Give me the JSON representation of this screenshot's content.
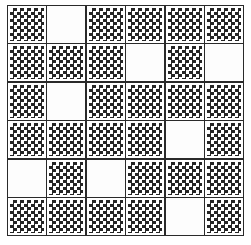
{
  "diagram": {
    "title": "",
    "type": "6x6 grid pattern",
    "rows": 6,
    "columns": 6,
    "cell_fill_legend": {
      "D": "dotted (black dot pattern)",
      "W": "white (empty)"
    },
    "colors": {
      "line": "#2a2a2a",
      "dot": "#1a1a1a",
      "background": "#ffffff"
    },
    "grid": [
      [
        "D",
        "W",
        "D",
        "D",
        "D",
        "D"
      ],
      [
        "D",
        "D",
        "D",
        "W",
        "D",
        "W"
      ],
      [
        "D",
        "W",
        "D",
        "D",
        "D",
        "D"
      ],
      [
        "D",
        "D",
        "D",
        "D",
        "W",
        "D"
      ],
      [
        "W",
        "D",
        "W",
        "D",
        "D",
        "D"
      ],
      [
        "D",
        "D",
        "D",
        "D",
        "W",
        "D"
      ]
    ]
  }
}
